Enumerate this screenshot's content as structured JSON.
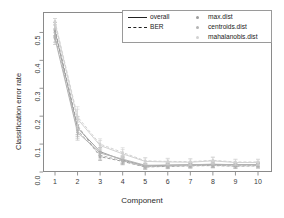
{
  "chart_data": {
    "type": "line",
    "title": "",
    "xlabel": "Component",
    "ylabel": "Classification error rate",
    "x": [
      1,
      2,
      3,
      4,
      5,
      6,
      7,
      8,
      9,
      10
    ],
    "xlim": [
      1,
      10
    ],
    "ylim": [
      0.0,
      0.55
    ],
    "yticks": [
      "0.0",
      "0.1",
      "0.2",
      "0.3",
      "0.4",
      "0.5"
    ],
    "ytick_values": [
      0.0,
      0.1,
      0.2,
      0.3,
      0.4,
      0.5
    ],
    "xticks": [
      "1",
      "2",
      "3",
      "4",
      "5",
      "6",
      "7",
      "8",
      "9",
      "10"
    ],
    "grid": false,
    "legend_position": "top",
    "error_bars": true,
    "series": [
      {
        "name": "max.dist overall",
        "dist": "max.dist",
        "measure": "overall",
        "linestyle": "solid",
        "color": "#9e9e9e",
        "values": [
          0.505,
          0.158,
          0.073,
          0.043,
          0.022,
          0.024,
          0.026,
          0.027,
          0.026,
          0.027
        ],
        "err": [
          0.022,
          0.03,
          0.015,
          0.012,
          0.008,
          0.008,
          0.008,
          0.009,
          0.008,
          0.008
        ]
      },
      {
        "name": "max.dist BER",
        "dist": "max.dist",
        "measure": "BER",
        "linestyle": "dashed",
        "color": "#9e9e9e",
        "values": [
          0.512,
          0.166,
          0.055,
          0.038,
          0.018,
          0.02,
          0.022,
          0.023,
          0.021,
          0.022
        ],
        "err": [
          0.024,
          0.032,
          0.014,
          0.012,
          0.008,
          0.008,
          0.008,
          0.008,
          0.008,
          0.008
        ]
      },
      {
        "name": "centroids.dist overall",
        "dist": "centroids.dist",
        "measure": "overall",
        "linestyle": "solid",
        "color": "#b4b4b4",
        "values": [
          0.478,
          0.142,
          0.068,
          0.046,
          0.024,
          0.025,
          0.026,
          0.028,
          0.026,
          0.027
        ],
        "err": [
          0.021,
          0.028,
          0.015,
          0.013,
          0.008,
          0.008,
          0.009,
          0.009,
          0.008,
          0.008
        ]
      },
      {
        "name": "centroids.dist BER",
        "dist": "centroids.dist",
        "measure": "BER",
        "linestyle": "dashed",
        "color": "#b4b4b4",
        "values": [
          0.487,
          0.15,
          0.06,
          0.04,
          0.019,
          0.021,
          0.023,
          0.024,
          0.022,
          0.023
        ],
        "err": [
          0.022,
          0.029,
          0.014,
          0.012,
          0.008,
          0.008,
          0.008,
          0.008,
          0.008,
          0.008
        ]
      },
      {
        "name": "mahalanobis.dist overall",
        "dist": "mahalanobis.dist",
        "measure": "overall",
        "linestyle": "solid",
        "color": "#d2d2d2",
        "values": [
          0.535,
          0.19,
          0.095,
          0.065,
          0.038,
          0.036,
          0.035,
          0.04,
          0.034,
          0.034
        ],
        "err": [
          0.025,
          0.035,
          0.018,
          0.016,
          0.012,
          0.011,
          0.011,
          0.012,
          0.01,
          0.01
        ]
      },
      {
        "name": "mahalanobis.dist BER",
        "dist": "mahalanobis.dist",
        "measure": "BER",
        "linestyle": "dashed",
        "color": "#d2d2d2",
        "values": [
          0.54,
          0.198,
          0.1,
          0.07,
          0.04,
          0.038,
          0.037,
          0.042,
          0.036,
          0.036
        ],
        "err": [
          0.026,
          0.036,
          0.019,
          0.017,
          0.012,
          0.011,
          0.011,
          0.012,
          0.01,
          0.01
        ]
      }
    ],
    "legend": {
      "measures": [
        {
          "label": "overall",
          "style": "solid"
        },
        {
          "label": "BER",
          "style": "dashed"
        }
      ],
      "distances": [
        {
          "label": "max.dist",
          "color": "#9e9e9e"
        },
        {
          "label": "centroids.dist",
          "color": "#b4b4b4"
        },
        {
          "label": "mahalanobis.dist",
          "color": "#d2d2d2"
        }
      ]
    }
  }
}
